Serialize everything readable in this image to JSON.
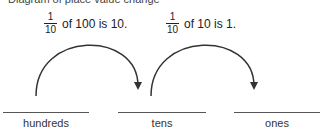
{
  "header": {
    "cut_text": "Diagram of place value change"
  },
  "statements": [
    {
      "numerator": "1",
      "denominator": "10",
      "text": "of 100 is 10."
    },
    {
      "numerator": "1",
      "denominator": "10",
      "text": "of 10 is 1."
    }
  ],
  "places": [
    {
      "label": "hundreds"
    },
    {
      "label": "tens"
    },
    {
      "label": "ones"
    }
  ],
  "colors": {
    "stroke": "#333333",
    "text": "#222222",
    "line": "#555555"
  }
}
